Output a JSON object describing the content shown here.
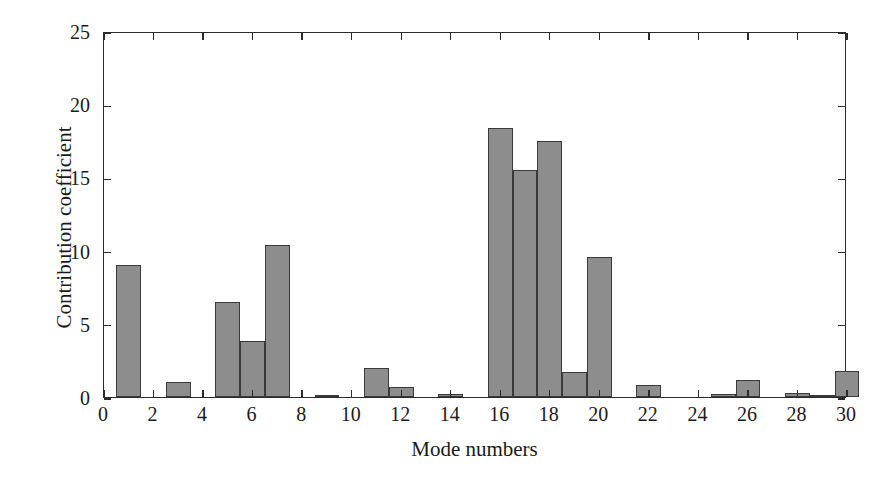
{
  "chart_data": {
    "type": "bar",
    "title": "",
    "xlabel": "Mode numbers",
    "ylabel": "Contribution coefficient",
    "xlim": [
      0,
      30
    ],
    "ylim": [
      0,
      25
    ],
    "xticks": [
      0,
      2,
      4,
      6,
      8,
      10,
      12,
      14,
      16,
      18,
      20,
      22,
      24,
      26,
      28,
      30
    ],
    "yticks": [
      0,
      5,
      10,
      15,
      20,
      25
    ],
    "xtick_labels": [
      "0",
      "2",
      "4",
      "6",
      "8",
      "10",
      "12",
      "14",
      "16",
      "18",
      "20",
      "22",
      "24",
      "26",
      "28",
      "30"
    ],
    "ytick_labels": [
      "0",
      "5",
      "10",
      "15",
      "20",
      "25"
    ],
    "grid": false,
    "legend": null,
    "bar_color": "#8d8d8d",
    "bar_edge_color": "#3a3a3a",
    "bar_width": 1,
    "categories": [
      1,
      2,
      3,
      4,
      5,
      6,
      7,
      8,
      9,
      10,
      11,
      12,
      13,
      14,
      15,
      16,
      17,
      18,
      19,
      20,
      21,
      22,
      23,
      24,
      25,
      26,
      27,
      28,
      29,
      30
    ],
    "values": [
      9.0,
      0.0,
      1.05,
      0.0,
      6.5,
      3.8,
      10.35,
      0.0,
      0.15,
      0.0,
      2.0,
      0.7,
      0.0,
      0.2,
      0.0,
      18.35,
      15.5,
      17.5,
      1.7,
      9.55,
      0.0,
      0.85,
      0.0,
      0.0,
      0.2,
      1.15,
      0.0,
      0.3,
      0.05,
      1.75
    ]
  },
  "axes": {
    "xlabel": "Mode numbers",
    "ylabel": "Contribution coefficient"
  }
}
